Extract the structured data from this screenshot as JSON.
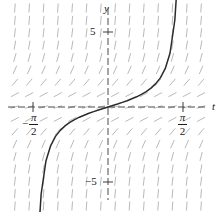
{
  "figure": {
    "kind": "slope-field-with-solution-curve",
    "background_color": "#ffffff",
    "axis_color": "#4a4a4a",
    "field_color": "#b9b9bd",
    "curve_color": "#2b2b2b"
  },
  "labels": {
    "y_axis": "y",
    "t_axis": "t",
    "y_tick_positive": "5",
    "y_tick_negative": "−5",
    "t_tick_negative": {
      "sign": "−",
      "numerator": "π",
      "denominator": "2"
    },
    "t_tick_positive": {
      "sign": "",
      "numerator": "π",
      "denominator": "2"
    }
  },
  "chart_data": {
    "type": "line",
    "title": "",
    "subtitle": "",
    "xlabel": "t",
    "ylabel": "y",
    "grid": false,
    "legend": "none",
    "xlim": [
      -2.05,
      2.05
    ],
    "ylim": [
      -6.9,
      6.9
    ],
    "xticks": [
      -1.5708,
      1.5708
    ],
    "xticklabels": [
      "-π/2",
      "π/2"
    ],
    "yticks": [
      5,
      -5
    ],
    "yticklabels": [
      "5",
      "-5"
    ],
    "asymptotes": [
      -1.5708,
      1.5708
    ],
    "series": [
      {
        "name": "y = tan(t)",
        "equation": "y' = 1 + y^2",
        "x": [
          -1.45,
          -1.4,
          -1.3,
          -1.2,
          -1.1,
          -1.0,
          -0.9,
          -0.8,
          -0.7,
          -0.6,
          -0.5,
          -0.4,
          -0.3,
          -0.2,
          -0.1,
          0.0,
          0.1,
          0.2,
          0.3,
          0.4,
          0.5,
          0.6,
          0.7,
          0.8,
          0.9,
          1.0,
          1.1,
          1.2,
          1.3,
          1.4,
          1.45
        ],
        "values": [
          -8.24,
          -5.8,
          -3.6,
          -2.57,
          -1.96,
          -1.56,
          -1.26,
          -1.03,
          -0.84,
          -0.68,
          -0.55,
          -0.42,
          -0.31,
          -0.2,
          -0.1,
          0.0,
          0.1,
          0.2,
          0.31,
          0.42,
          0.55,
          0.68,
          0.84,
          1.03,
          1.26,
          1.56,
          1.96,
          2.57,
          3.6,
          5.8,
          8.24
        ]
      }
    ],
    "slope_field": {
      "description": "Short dashed line segments with slope 1 + y^2 drawn on a rectangular grid",
      "x_range": [
        -1.95,
        1.95
      ],
      "y_range": [
        -6.6,
        6.6
      ],
      "x_count": 14,
      "y_count": 17,
      "slope_formula": "1 + y^2"
    }
  }
}
